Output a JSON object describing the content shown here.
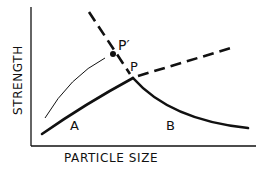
{
  "diagram": {
    "axes": {
      "x_label": "PARTICLE SIZE",
      "y_label": "STRENGTH"
    },
    "points": {
      "p": "P",
      "p_prime": "P′"
    },
    "regions": {
      "a": "A",
      "b": "B"
    },
    "colors": {
      "ink": "#111111",
      "background": "#ffffff"
    }
  }
}
